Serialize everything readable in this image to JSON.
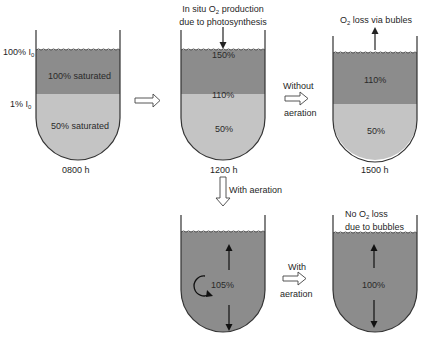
{
  "colors": {
    "dark_fill": "#8c8c8c",
    "light_fill": "#c4c4c4",
    "outline": "#333333",
    "background": "#ffffff"
  },
  "tank_0800": {
    "time_label": "0800 h",
    "upper_layer": "100% saturated",
    "lower_layer": "50% saturated",
    "level_label_top": "100% I",
    "level_label_top_sub": "0",
    "level_label_mid": "1% I",
    "level_label_mid_sub": "0"
  },
  "arrow_0800_to_1200": {
    "icon": "hollow-right-arrow-icon"
  },
  "tank_1200": {
    "time_label": "1200 h",
    "annotation_line1_pre": "In situ O",
    "annotation_line1_sub": "2",
    "annotation_line1_post": " production",
    "annotation_line2": "due to photosynthesis",
    "surface_value": "150%",
    "upper_value": "110%",
    "lower_value": "50%"
  },
  "arrow_without_aeration": {
    "label_top": "Without",
    "label_bottom": "aeration"
  },
  "tank_1500": {
    "time_label": "1500 h",
    "annotation_pre": "O",
    "annotation_sub": "2",
    "annotation_post": "  loss via bubles",
    "upper_value": "110%",
    "lower_value": "50%"
  },
  "arrow_with_aeration_down": {
    "label": "With aeration"
  },
  "tank_aerated": {
    "value": "105%",
    "icons": [
      "circulation-icon",
      "up-arrow-icon",
      "down-arrow-icon"
    ]
  },
  "arrow_with_aeration_right": {
    "label_top": "With",
    "label_bottom": "aeration"
  },
  "tank_final": {
    "annotation_line1_pre": "No O",
    "annotation_line1_sub": "2",
    "annotation_line1_post": "  loss",
    "annotation_line2": "due to bubbles",
    "value": "100%"
  }
}
